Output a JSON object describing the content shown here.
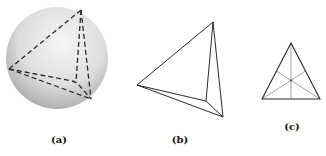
{
  "figure": {
    "panels": [
      {
        "id": "a",
        "label": "(a)",
        "description": "Spherical tetrahedron inscribed in a sphere (dashed edges)"
      },
      {
        "id": "b",
        "label": "(b)",
        "description": "Tetrahedron in perspective view (solid edges)"
      },
      {
        "id": "c",
        "label": "(c)",
        "description": "Triangle with medians meeting at centroid"
      }
    ]
  },
  "colors": {
    "line": "#2a2a2a",
    "median": "#7a7a7a",
    "sphere_light": "#f4f4f4",
    "sphere_dark": "#9a9a9a"
  }
}
